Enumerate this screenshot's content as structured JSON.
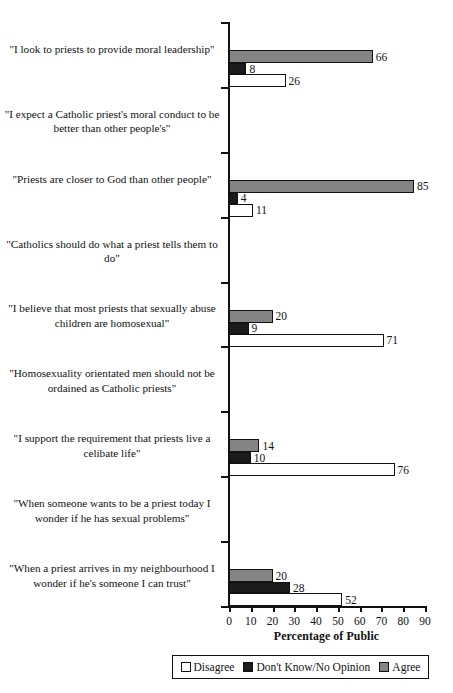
{
  "chart_data": {
    "type": "bar",
    "orientation": "horizontal",
    "title": "",
    "xlabel": "Percentage of Public",
    "ylabel": "",
    "xlim": [
      0,
      90
    ],
    "xticks": [
      0,
      10,
      20,
      30,
      40,
      50,
      60,
      70,
      80,
      90
    ],
    "grid": false,
    "legend_position": "bottom",
    "series": [
      {
        "name": "Disagree",
        "color": "#ffffff",
        "values": [
          26,
          11,
          71,
          76,
          52,
          35,
          74,
          76,
          40
        ]
      },
      {
        "name": "Don't Know/No Opinion",
        "color": "#1b1b1b",
        "values": [
          8,
          4,
          9,
          10,
          28,
          26,
          9,
          10,
          19
        ]
      },
      {
        "name": "Agree",
        "color": "#848484",
        "values": [
          66,
          85,
          20,
          14,
          20,
          39,
          17,
          14,
          51
        ]
      }
    ],
    "categories": [
      "\"I look to priests to provide moral leadership\"",
      "\"I expect a Catholic priest's moral conduct to be better than other people's\"",
      "\"Priests are closer to God than other people\"",
      "\"Catholics should do what a priest tells them to do\"",
      "\"I believe that most priests that sexually abuse children are homosexual\"",
      "\"Homosexuality orientated men should not be ordained as Catholic priests\"",
      "\"I support the requirement that priests live a celibate life\"",
      "\"When someone wants to be a priest today I wonder if he has sexual problems\"",
      "\"When a priest arrives in my neighbourhood I wonder if he's someone I can trust\""
    ]
  },
  "legend": {
    "items": [
      {
        "label": "Disagree",
        "key": "disagree"
      },
      {
        "label": "Don't Know/No Opinion",
        "key": "dk"
      },
      {
        "label": "Agree",
        "key": "agree"
      }
    ]
  },
  "axis": {
    "x_title": "Percentage of Public"
  }
}
